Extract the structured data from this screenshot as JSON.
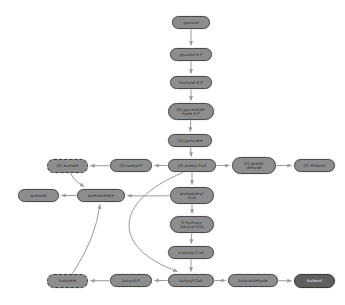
{
  "diagram": {
    "node_fill": "#8d8d8d",
    "node_fill_dark": "#5f5f5f",
    "edge_color": "#9a9a9a",
    "background": "#ffffff"
  },
  "nodes": [
    {
      "id": "glucose",
      "label": "glucose",
      "x": 172,
      "y": 16,
      "w": 38,
      "h": 13,
      "style": "solid"
    },
    {
      "id": "glucose6p",
      "label": "glucose 6-P",
      "x": 170,
      "y": 48,
      "w": 42,
      "h": 13,
      "style": "solid"
    },
    {
      "id": "fructose6p",
      "label": "fructose 6-P",
      "x": 170,
      "y": 76,
      "w": 42,
      "h": 13,
      "style": "solid"
    },
    {
      "id": "ga3p",
      "label": "(2) glyceralde-\nhyde 3-P",
      "x": 168,
      "y": 103,
      "w": 46,
      "h": 17,
      "style": "solid"
    },
    {
      "id": "pyruvate",
      "label": "(2) pyruvate",
      "x": 168,
      "y": 134,
      "w": 44,
      "h": 13,
      "style": "solid"
    },
    {
      "id": "acetate",
      "label": "(2) acetate",
      "x": 47,
      "y": 159,
      "w": 41,
      "h": 14,
      "style": "dashed"
    },
    {
      "id": "acetylp",
      "label": "(2) acetyl-P",
      "x": 110,
      "y": 159,
      "w": 42,
      "h": 13,
      "style": "solid"
    },
    {
      "id": "acetylcoa",
      "label": "(2) acetyl-CoA",
      "x": 168,
      "y": 159,
      "w": 48,
      "h": 13,
      "style": "solid"
    },
    {
      "id": "acetaldehyde",
      "label": "(2) acetal-\ndehyde",
      "x": 232,
      "y": 157,
      "w": 44,
      "h": 17,
      "style": "solid"
    },
    {
      "id": "ethanol",
      "label": "(2) ethanol",
      "x": 294,
      "y": 159,
      "w": 41,
      "h": 13,
      "style": "solid"
    },
    {
      "id": "acetone",
      "label": "acetone",
      "x": 18,
      "y": 189,
      "w": 41,
      "h": 13,
      "style": "solid"
    },
    {
      "id": "acetoacetate",
      "label": "acetoacetate",
      "x": 77,
      "y": 189,
      "w": 48,
      "h": 13,
      "style": "solid"
    },
    {
      "id": "acetoacetylcoa",
      "label": "acetoacetyl-\nCoA",
      "x": 170,
      "y": 187,
      "w": 44,
      "h": 17,
      "style": "solid"
    },
    {
      "id": "hydroxybutcoa",
      "label": "3-hydroxy-\nbutyryl-CoA",
      "x": 170,
      "y": 216,
      "w": 44,
      "h": 17,
      "style": "solid"
    },
    {
      "id": "crotonylcoa",
      "label": "crotonyl-CoA",
      "x": 168,
      "y": 246,
      "w": 46,
      "h": 13,
      "style": "solid"
    },
    {
      "id": "butyrate",
      "label": "butyrate",
      "x": 47,
      "y": 274,
      "w": 41,
      "h": 14,
      "style": "dashed"
    },
    {
      "id": "butyrylp",
      "label": "butyryl-P",
      "x": 110,
      "y": 274,
      "w": 42,
      "h": 13,
      "style": "solid"
    },
    {
      "id": "butyrylcoa",
      "label": "butyryl-CoA",
      "x": 168,
      "y": 274,
      "w": 46,
      "h": 13,
      "style": "solid"
    },
    {
      "id": "butyraldehyde",
      "label": "butyraldehyde",
      "x": 228,
      "y": 274,
      "w": 50,
      "h": 13,
      "style": "solid"
    },
    {
      "id": "butanol",
      "label": "butanol",
      "x": 294,
      "y": 274,
      "w": 41,
      "h": 14,
      "style": "dark"
    }
  ],
  "edges": [
    {
      "from": "glucose",
      "to": "glucose6p",
      "kind": "straight"
    },
    {
      "from": "glucose6p",
      "to": "fructose6p",
      "kind": "straight"
    },
    {
      "from": "fructose6p",
      "to": "ga3p",
      "kind": "straight"
    },
    {
      "from": "ga3p",
      "to": "pyruvate",
      "kind": "straight"
    },
    {
      "from": "pyruvate",
      "to": "acetylcoa",
      "kind": "straight"
    },
    {
      "from": "acetylcoa",
      "to": "acetylp",
      "kind": "straight"
    },
    {
      "from": "acetylp",
      "to": "acetate",
      "kind": "straight"
    },
    {
      "from": "acetylcoa",
      "to": "acetaldehyde",
      "kind": "straight"
    },
    {
      "from": "acetaldehyde",
      "to": "ethanol",
      "kind": "straight"
    },
    {
      "from": "acetylcoa",
      "to": "acetoacetylcoa",
      "kind": "straight"
    },
    {
      "from": "acetoacetylcoa",
      "to": "hydroxybutcoa",
      "kind": "straight"
    },
    {
      "from": "hydroxybutcoa",
      "to": "crotonylcoa",
      "kind": "straight"
    },
    {
      "from": "crotonylcoa",
      "to": "butyrylcoa",
      "kind": "straight"
    },
    {
      "from": "butyrylcoa",
      "to": "butyrylp",
      "kind": "straight"
    },
    {
      "from": "butyrylp",
      "to": "butyrate",
      "kind": "straight"
    },
    {
      "from": "butyrylcoa",
      "to": "butyraldehyde",
      "kind": "straight"
    },
    {
      "from": "butyraldehyde",
      "to": "butanol",
      "kind": "straight"
    },
    {
      "from": "acetoacetate",
      "to": "acetone",
      "kind": "straight"
    },
    {
      "from": "acetoacetylcoa",
      "to": "acetoacetate",
      "kind": "curve",
      "cx": 150,
      "cy": 196
    },
    {
      "from": "acetate",
      "to": "acetoacetate",
      "kind": "curve",
      "cx": 74,
      "cy": 181
    },
    {
      "from": "butyrate",
      "to": "acetoacetate",
      "kind": "curve",
      "cx": 96,
      "cy": 238
    },
    {
      "from": "acetylcoa",
      "to": "butyrylcoa",
      "kind": "curve2",
      "cx": 112,
      "cy": 228
    }
  ]
}
